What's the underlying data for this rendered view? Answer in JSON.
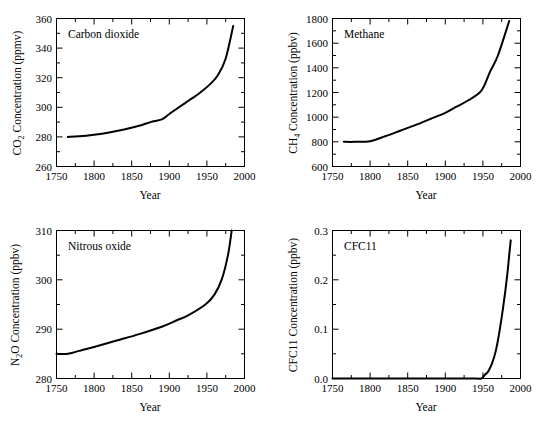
{
  "figure": {
    "background": "#ffffff",
    "line_color": "#000000",
    "panel_count": 4
  },
  "chart_data": [
    {
      "type": "line",
      "title": "Carbon dioxide",
      "xlabel": "Year",
      "ylabel": "CO2 Concentration (ppmv)",
      "ylabel_parts": {
        "pre": "CO",
        "sub": "2",
        "post": " Concentration (ppmv)"
      },
      "xlim": [
        1750,
        2000
      ],
      "ylim": [
        260,
        360
      ],
      "xticks": [
        1750,
        1800,
        1850,
        1900,
        1950,
        2000
      ],
      "xtick_labels": [
        "1750",
        "1800",
        "1850",
        "1900",
        "1950",
        "2000"
      ],
      "yticks": [
        260,
        280,
        300,
        320,
        340,
        360
      ],
      "ytick_labels": [
        "260",
        "280",
        "300",
        "320",
        "340",
        "360"
      ],
      "minor_xticks": [
        1775,
        1825,
        1875,
        1925,
        1975
      ],
      "minor_yticks": [
        270,
        290,
        310,
        330,
        350
      ],
      "grid": false,
      "legend": "none",
      "units": "ppmv",
      "x": [
        1765,
        1780,
        1800,
        1820,
        1840,
        1860,
        1875,
        1890,
        1900,
        1910,
        1920,
        1930,
        1940,
        1955,
        1965,
        1975,
        1985
      ],
      "values": [
        280.0,
        280.4,
        281.5,
        283.0,
        285.0,
        287.5,
        290.0,
        291.8,
        295.5,
        299.0,
        302.5,
        306.0,
        309.5,
        316.0,
        322.0,
        333.0,
        355.0
      ]
    },
    {
      "type": "line",
      "title": "Methane",
      "xlabel": "Year",
      "ylabel": "CH4 Concentration (ppbv)",
      "ylabel_parts": {
        "pre": "CH",
        "sub": "4",
        "post": " Concentration (ppbv)"
      },
      "xlim": [
        1750,
        2000
      ],
      "ylim": [
        600,
        1800
      ],
      "xticks": [
        1750,
        1800,
        1850,
        1900,
        1950,
        2000
      ],
      "xtick_labels": [
        "1750",
        "1800",
        "1850",
        "1900",
        "1950",
        "2000"
      ],
      "yticks": [
        600,
        800,
        1000,
        1200,
        1400,
        1600,
        1800
      ],
      "ytick_labels": [
        "600",
        "800",
        "1000",
        "1200",
        "1400",
        "1600",
        "1800"
      ],
      "minor_xticks": [
        1775,
        1825,
        1875,
        1925,
        1975
      ],
      "minor_yticks": [
        700,
        900,
        1100,
        1300,
        1500,
        1700
      ],
      "grid": false,
      "legend": "none",
      "units": "ppbv",
      "x": [
        1765,
        1780,
        1800,
        1820,
        1840,
        1860,
        1880,
        1900,
        1915,
        1930,
        1948,
        1960,
        1970,
        1985
      ],
      "values": [
        800,
        800,
        805,
        845,
        890,
        935,
        985,
        1035,
        1085,
        1135,
        1215,
        1375,
        1500,
        1780
      ]
    },
    {
      "type": "line",
      "title": "Nitrous oxide",
      "xlabel": "Year",
      "ylabel": "N2O Concentration (ppbv)",
      "ylabel_parts": {
        "pre": "N",
        "sub": "2",
        "post": "O Concentration (ppbv)"
      },
      "xlim": [
        1750,
        2000
      ],
      "ylim": [
        280,
        310
      ],
      "xticks": [
        1750,
        1800,
        1850,
        1900,
        1950,
        2000
      ],
      "xtick_labels": [
        "1750",
        "1800",
        "1850",
        "1900",
        "1950",
        "2000"
      ],
      "yticks": [
        280,
        290,
        300,
        310
      ],
      "ytick_labels": [
        "280",
        "290",
        "300",
        "310"
      ],
      "minor_xticks": [
        1775,
        1825,
        1875,
        1925,
        1975
      ],
      "minor_yticks": [
        285,
        295,
        305
      ],
      "grid": false,
      "legend": "none",
      "units": "ppbv",
      "x": [
        1750,
        1765,
        1780,
        1800,
        1830,
        1860,
        1890,
        1910,
        1925,
        1948,
        1960,
        1970,
        1978,
        1983
      ],
      "values": [
        285.0,
        285.0,
        285.6,
        286.4,
        287.7,
        289.0,
        290.5,
        291.8,
        292.8,
        295.0,
        297.0,
        300.2,
        305.0,
        310.0
      ]
    },
    {
      "type": "line",
      "title": "CFC11",
      "xlabel": "Year",
      "ylabel": "CFC11 Concentration (ppbv)",
      "ylabel_parts": {
        "pre": "CFC11 Concentration (ppbv)",
        "sub": "",
        "post": ""
      },
      "xlim": [
        1750,
        2000
      ],
      "ylim": [
        0.0,
        0.3
      ],
      "xticks": [
        1750,
        1800,
        1850,
        1900,
        1950,
        2000
      ],
      "xtick_labels": [
        "1750",
        "1800",
        "1850",
        "1900",
        "1950",
        "2000"
      ],
      "yticks": [
        0.0,
        0.1,
        0.2,
        0.3
      ],
      "ytick_labels": [
        "0.0",
        "0.1",
        "0.2",
        "0.3"
      ],
      "minor_xticks": [
        1775,
        1825,
        1875,
        1925,
        1975
      ],
      "minor_yticks": [
        0.05,
        0.15,
        0.25
      ],
      "grid": false,
      "legend": "none",
      "units": "ppbv",
      "x": [
        1750,
        1900,
        1940,
        1948,
        1953,
        1957,
        1962,
        1967,
        1972,
        1977,
        1982,
        1985,
        1987
      ],
      "values": [
        0.0,
        0.0,
        0.0,
        0.0,
        0.008,
        0.014,
        0.03,
        0.055,
        0.095,
        0.145,
        0.205,
        0.25,
        0.28
      ]
    }
  ]
}
